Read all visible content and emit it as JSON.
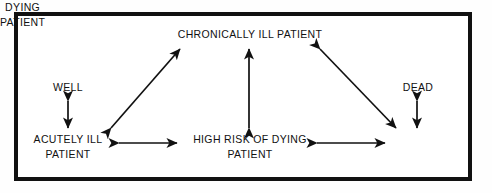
{
  "diagram": {
    "frame": {
      "border_color": "#111111",
      "background": "#ffffff"
    },
    "nodes": [
      {
        "id": "chronically-ill-patient",
        "line1": "CHRONICALLY ILL PATIENT",
        "line2": ""
      },
      {
        "id": "well",
        "line1": "WELL",
        "line2": ""
      },
      {
        "id": "dead",
        "line1": "DEAD",
        "line2": ""
      },
      {
        "id": "acutely-ill-patient",
        "line1": "ACUTELY ILL",
        "line2": "PATIENT"
      },
      {
        "id": "high-risk-of-dying-patient",
        "line1": "HIGH RISK OF DYING",
        "line2": "PATIENT"
      },
      {
        "id": "dying-patient",
        "line1": "DYING",
        "line2": "PATIENT"
      }
    ],
    "edges": [
      {
        "id": "well-acutely-ill",
        "from": "well",
        "to": "acutely-ill-patient",
        "style": "double-headed",
        "orientation": "vertical"
      },
      {
        "id": "acutely-ill-chronically-ill",
        "from": "acutely-ill-patient",
        "to": "chronically-ill-patient",
        "style": "double-headed",
        "orientation": "diagonal-up-right"
      },
      {
        "id": "high-risk-chronically-ill",
        "from": "high-risk-of-dying-patient",
        "to": "chronically-ill-patient",
        "style": "double-headed",
        "orientation": "vertical"
      },
      {
        "id": "chronically-ill-dying",
        "from": "chronically-ill-patient",
        "to": "dying-patient",
        "style": "double-headed",
        "orientation": "diagonal-down-right"
      },
      {
        "id": "acutely-ill-high-risk",
        "from": "acutely-ill-patient",
        "to": "high-risk-of-dying-patient",
        "style": "double-headed",
        "orientation": "horizontal"
      },
      {
        "id": "high-risk-dying",
        "from": "high-risk-of-dying-patient",
        "to": "dying-patient",
        "style": "double-headed",
        "orientation": "horizontal"
      },
      {
        "id": "dying-dead",
        "from": "dying-patient",
        "to": "dead",
        "style": "double-headed",
        "orientation": "vertical"
      }
    ],
    "stroke_color": "#111111",
    "text_color": "#111111"
  }
}
